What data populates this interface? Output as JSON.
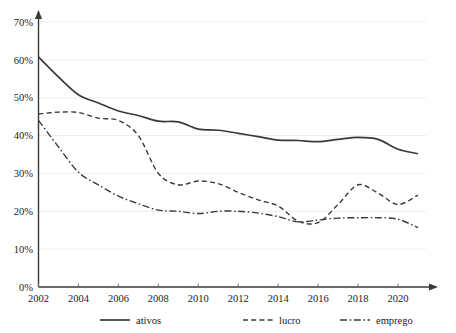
{
  "chart_data": {
    "type": "line",
    "title": "",
    "subtitle": "",
    "xlabel": "",
    "ylabel": "",
    "xlim": [
      2002,
      2021
    ],
    "ylim": [
      0,
      70
    ],
    "y_tick_step": 10,
    "grid": true,
    "grid_axis": "y",
    "legend_position": "bottom",
    "x": [
      2002,
      2003,
      2004,
      2005,
      2006,
      2007,
      2008,
      2009,
      2010,
      2011,
      2012,
      2013,
      2014,
      2015,
      2016,
      2017,
      2018,
      2019,
      2020,
      2021
    ],
    "x_tick_labels": [
      "2002",
      "2004",
      "2006",
      "2008",
      "2010",
      "2012",
      "2014",
      "2016",
      "2018",
      "2020"
    ],
    "x_tick_values": [
      2002,
      2004,
      2006,
      2008,
      2010,
      2012,
      2014,
      2016,
      2018,
      2020
    ],
    "y_tick_labels": [
      "0%",
      "10%",
      "20%",
      "30%",
      "40%",
      "50%",
      "60%",
      "70%"
    ],
    "y_tick_values": [
      0,
      10,
      20,
      30,
      40,
      50,
      60,
      70
    ],
    "series": [
      {
        "name": "ativos",
        "style": "solid",
        "color": "#3a3a3a",
        "values": [
          60.8,
          55.5,
          50.8,
          48.6,
          46.5,
          45.3,
          43.8,
          43.6,
          41.7,
          41.4,
          40.6,
          39.7,
          38.8,
          38.7,
          38.4,
          39.0,
          39.5,
          39.0,
          36.4,
          35.2
        ]
      },
      {
        "name": "lucro",
        "style": "dashed",
        "color": "#3a3a3a",
        "values": [
          45.7,
          46.2,
          46.1,
          44.6,
          44.0,
          40.0,
          30.0,
          27.0,
          28.0,
          27.3,
          25.0,
          23.0,
          21.4,
          17.4,
          17.0,
          21.8,
          27.0,
          24.8,
          21.8,
          24.3
        ]
      },
      {
        "name": "emprego",
        "style": "dashdot",
        "color": "#3a3a3a",
        "values": [
          44.0,
          37.0,
          30.3,
          27.0,
          24.0,
          22.0,
          20.3,
          20.0,
          19.4,
          20.0,
          20.0,
          19.5,
          18.6,
          17.2,
          17.7,
          18.2,
          18.3,
          18.3,
          17.9,
          15.7
        ]
      }
    ]
  },
  "legend": {
    "items": [
      {
        "label": "ativos",
        "style": "solid"
      },
      {
        "label": "lucro",
        "style": "dashed"
      },
      {
        "label": "emprego",
        "style": "dashdot"
      }
    ]
  },
  "colors": {
    "ink": "#3a3a3a",
    "grid": "#e8e8e8",
    "background": "#ffffff"
  }
}
